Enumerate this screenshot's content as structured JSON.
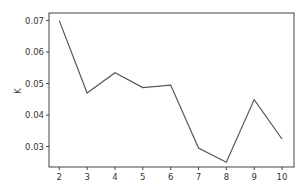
{
  "chart_data": {
    "type": "line",
    "title": "",
    "xlabel": "",
    "ylabel": "K",
    "x": [
      2,
      3,
      4,
      5,
      6,
      7,
      8,
      9,
      10
    ],
    "series": [
      {
        "name": "K",
        "values": [
          0.07,
          0.047,
          0.0534,
          0.0487,
          0.0495,
          0.0295,
          0.025,
          0.0449,
          0.0324
        ],
        "color": "#555555"
      }
    ],
    "xticks": [
      2,
      3,
      4,
      5,
      6,
      7,
      8,
      9,
      10
    ],
    "xtick_labels": [
      "2",
      "3",
      "4",
      "5",
      "6",
      "7",
      "8",
      "9",
      "10"
    ],
    "yticks": [
      0.03,
      0.04,
      0.05,
      0.06,
      0.07
    ],
    "ytick_labels": [
      "0.03",
      "0.04",
      "0.05",
      "0.06",
      "0.07"
    ],
    "xlim": [
      1.63,
      10.43
    ],
    "ylim": [
      0.0235,
      0.0724
    ],
    "grid": false,
    "legend": null
  },
  "colors": {
    "line": "#555555",
    "axes": "#444444",
    "text": "#333333",
    "background": "#ffffff"
  }
}
